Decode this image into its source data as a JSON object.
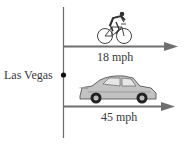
{
  "diagram": {
    "origin_label": "Las Vegas",
    "bicycle": {
      "speed_label": "18 mph",
      "icon": "bicycle-icon"
    },
    "car": {
      "speed_label": "45 mph",
      "icon": "car-icon"
    },
    "colors": {
      "axis": "#6b6b6b",
      "arrow": "#6e6e6e",
      "dot": "#111111",
      "text": "#3a3a3a",
      "car_body": "#bdbdbd"
    }
  }
}
